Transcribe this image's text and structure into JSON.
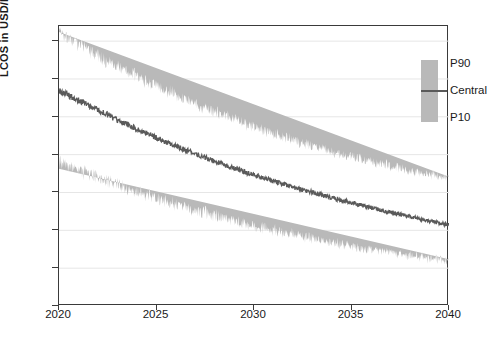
{
  "chart_data": {
    "type": "area",
    "title": "",
    "subtitle": "",
    "xlabel": "",
    "ylabel": "LCOS in USD/MWh",
    "xlim": [
      2020,
      2040
    ],
    "ylim": [
      0,
      370
    ],
    "xticks": [
      2020,
      2025,
      2030,
      2035,
      2040
    ],
    "yticks": [
      0,
      50,
      100,
      150,
      200,
      250,
      300,
      350
    ],
    "grid": true,
    "grid_axis": "y",
    "legend_position": "top-right",
    "legend": [
      "P90",
      "Central",
      "P10"
    ],
    "colors": {
      "band_fill": "#b9b9b9",
      "central_line": "#5a5a5a",
      "frame": "#3a3a3a",
      "gridline": "#e6e6e6",
      "background": "#ffffff"
    },
    "x": [
      2020,
      2021,
      2022,
      2023,
      2024,
      2025,
      2026,
      2027,
      2028,
      2029,
      2030,
      2031,
      2032,
      2033,
      2034,
      2035,
      2036,
      2037,
      2038,
      2039,
      2040
    ],
    "series": [
      {
        "name": "P90",
        "values": [
          352,
          337,
          322,
          308,
          295,
          283,
          271,
          260,
          249,
          239,
          230,
          221,
          213,
          205,
          198,
          191,
          185,
          179,
          173,
          168,
          163
        ]
      },
      {
        "name": "Central",
        "values": [
          285,
          272,
          259,
          246,
          234,
          222,
          211,
          201,
          191,
          182,
          173,
          165,
          157,
          150,
          143,
          137,
          130,
          124,
          118,
          112,
          107
        ]
      },
      {
        "name": "P10",
        "values": [
          198,
          188,
          178,
          168,
          159,
          150,
          142,
          134,
          127,
          120,
          113,
          107,
          101,
          96,
          91,
          86,
          81,
          77,
          73,
          69,
          65
        ]
      }
    ],
    "endpoints": {
      "2020": {
        "p90": 352,
        "central": 285,
        "p10": 198
      },
      "2040": {
        "p90": 163,
        "central": 107,
        "p10": 65
      }
    }
  },
  "y_axis": {
    "title": "LCOS in USD/MWh",
    "ticks": [
      "350",
      "300",
      "250",
      "200",
      "150",
      "100",
      "50",
      "0"
    ]
  },
  "x_axis": {
    "ticks": [
      "2020",
      "2025",
      "2030",
      "2035",
      "2040"
    ]
  },
  "legend": {
    "upper_label": "P90",
    "central_label": "Central",
    "lower_label": "P10"
  }
}
